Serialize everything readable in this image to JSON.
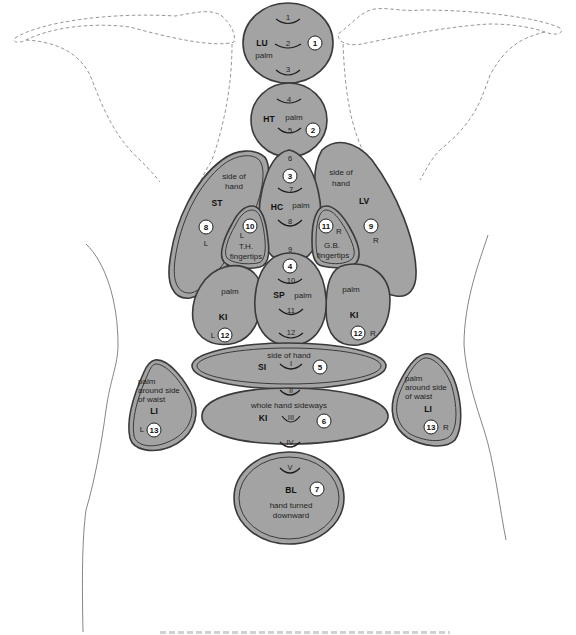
{
  "diagram": {
    "type": "body-meridian-zone-map",
    "colors": {
      "zone_fill": "#a3a3a3",
      "zone_stroke": "#3a3a3a",
      "badge_fill": "#ffffff",
      "outline": "#8a8a8a"
    },
    "zones": [
      {
        "id": "LU",
        "abbr": "LU",
        "hand": "palm",
        "badge": "1",
        "marks": [
          "1",
          "2",
          "3"
        ]
      },
      {
        "id": "HT",
        "abbr": "HT",
        "hand": "palm",
        "badge": "2",
        "marks": [
          "4",
          "5"
        ]
      },
      {
        "id": "HC",
        "abbr": "HC",
        "hand": "palm",
        "badge": "3",
        "marks": [
          "6",
          "7",
          "8",
          "9"
        ]
      },
      {
        "id": "SP",
        "abbr": "SP",
        "hand": "palm",
        "badge": "4",
        "marks": [
          "10",
          "11",
          "12"
        ]
      },
      {
        "id": "SI",
        "abbr": "SI",
        "hand": "side of hand",
        "badge": "5",
        "marks": [
          "I"
        ]
      },
      {
        "id": "KI-center",
        "abbr": "KI",
        "hand": "whole hand sideways",
        "badge": "6",
        "marks": [
          "II",
          "III",
          "IV"
        ]
      },
      {
        "id": "BL",
        "abbr": "BL",
        "hand_line1": "hand turned",
        "hand_line2": "downward",
        "badge": "7",
        "marks": [
          "V"
        ]
      },
      {
        "id": "ST",
        "abbr": "ST",
        "hand_line1": "side of",
        "hand_line2": "hand",
        "badge": "8",
        "side": "L"
      },
      {
        "id": "LV",
        "abbr": "LV",
        "hand_line1": "side of",
        "hand_line2": "hand",
        "badge": "9",
        "side": "R"
      },
      {
        "id": "TH",
        "abbr_line1": "T.H.",
        "abbr_line2": "fingertips",
        "badge": "10",
        "side": "L"
      },
      {
        "id": "GB",
        "abbr_line1": "G.B.",
        "abbr_line2": "fingertips",
        "badge": "11",
        "side": "R"
      },
      {
        "id": "KI-left",
        "abbr": "KI",
        "hand": "palm",
        "badge": "12",
        "side": "L"
      },
      {
        "id": "KI-right",
        "abbr": "KI",
        "hand": "palm",
        "badge": "12",
        "side": "R"
      },
      {
        "id": "LI-left",
        "abbr": "LI",
        "hand_line1": "palm",
        "hand_line2": "around side",
        "hand_line3": "of waist",
        "badge": "13",
        "side": "L"
      },
      {
        "id": "LI-right",
        "abbr": "LI",
        "hand_line1": "palm",
        "hand_line2": "around side",
        "hand_line3": "of waist",
        "badge": "13",
        "side": "R"
      }
    ]
  }
}
